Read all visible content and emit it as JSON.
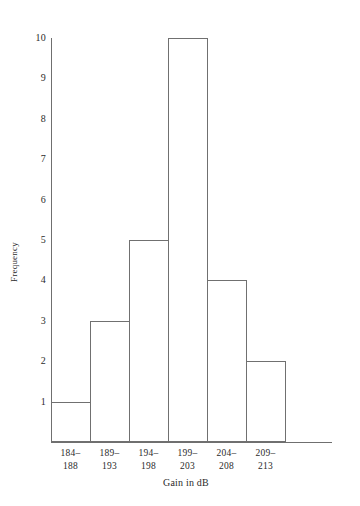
{
  "chart_data": {
    "type": "bar",
    "title": "",
    "xlabel": "Gain in dB",
    "ylabel": "Frequency",
    "categories": [
      "184–188",
      "189–193",
      "194–198",
      "199–203",
      "204–208",
      "209–213"
    ],
    "category_lines": [
      [
        "184–",
        "188"
      ],
      [
        "189–",
        "193"
      ],
      [
        "194–",
        "198"
      ],
      [
        "199–",
        "203"
      ],
      [
        "204–",
        "208"
      ],
      [
        "209–",
        "213"
      ]
    ],
    "values": [
      1,
      3,
      5,
      10,
      4,
      2
    ],
    "ylim": [
      0,
      10
    ],
    "yticks": [
      1,
      2,
      3,
      4,
      5,
      6,
      7,
      8,
      9,
      10
    ],
    "ytick_labels": [
      "1",
      "2",
      "3",
      "4",
      "5",
      "6",
      "7",
      "8",
      "9",
      "10"
    ],
    "grid": false,
    "legend": "none",
    "bar_fill": "#ffffff",
    "bar_outline": "#707070",
    "axis_color": "#6f6f6f",
    "background": "#ffffff",
    "text_color": "#2b2b2b"
  }
}
